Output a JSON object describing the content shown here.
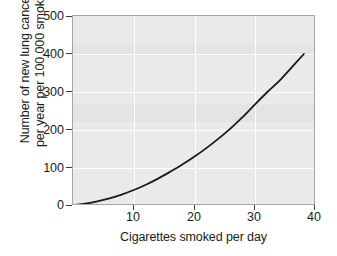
{
  "chart_data": {
    "type": "line",
    "title": "",
    "xlabel": "Cigarettes smoked per day",
    "ylabel_line1": "Number of new lung cancers",
    "ylabel_line2": "per year per 100,000 smokers",
    "ylabel": "Number of new lung cancers per year per 100,000 smokers",
    "xlim": [
      0,
      40
    ],
    "ylim": [
      0,
      500
    ],
    "xticks": [
      10,
      20,
      30,
      40
    ],
    "yticks": [
      0,
      100,
      200,
      300,
      400,
      500
    ],
    "xtick_labels": [
      "10",
      "20",
      "30",
      "40"
    ],
    "ytick_labels": [
      "0",
      "100",
      "200",
      "300",
      "400",
      "500"
    ],
    "grid": true,
    "grid_color": "#ffffff",
    "plot_background": "#eaeaea",
    "line_color": "#1a1a1a",
    "line_width": 1.8,
    "legend": "none",
    "series": [
      {
        "name": "New lung cancers per 100,000 smokers",
        "x": [
          0,
          2,
          4,
          6,
          8,
          10,
          12,
          14,
          16,
          18,
          20,
          22,
          24,
          26,
          28,
          30,
          32,
          34,
          36,
          38
        ],
        "values": [
          2,
          6,
          12,
          20,
          30,
          42,
          56,
          72,
          90,
          109,
          130,
          153,
          178,
          205,
          235,
          268,
          300,
          330,
          365,
          400
        ]
      }
    ],
    "annotations": []
  }
}
